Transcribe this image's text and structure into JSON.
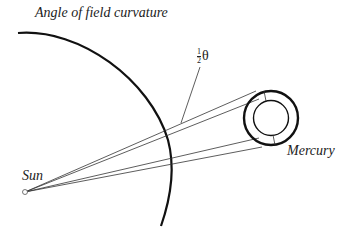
{
  "title": "Angle of field curvature",
  "labels": {
    "sun": "Sun",
    "mercury": "Mercury",
    "angle_num": "1",
    "angle_den": "2",
    "angle_symbol": "θ"
  },
  "colors": {
    "stroke": "#111111",
    "text": "#222222",
    "background": "#ffffff"
  }
}
